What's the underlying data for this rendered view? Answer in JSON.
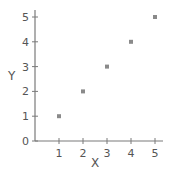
{
  "chart_data": {
    "type": "scatter",
    "title": "",
    "xlabel": "X",
    "ylabel": "Y",
    "x": [
      1,
      2,
      3,
      4,
      5
    ],
    "y": [
      1,
      2,
      3,
      4,
      5
    ],
    "series": [
      {
        "name": "",
        "x": [
          1,
          2,
          3,
          4,
          5
        ],
        "y": [
          1,
          2,
          3,
          4,
          5
        ],
        "color": "#8a8a8a",
        "marker": "square"
      }
    ],
    "xlim": [
      0,
      5.3
    ],
    "ylim": [
      0,
      5.2
    ],
    "xticks": [
      1,
      2,
      3,
      4,
      5
    ],
    "yticks": [
      0,
      1,
      2,
      3,
      4,
      5
    ],
    "xtick_labels": [
      "1",
      "2",
      "3",
      "4",
      "5"
    ],
    "ytick_labels": [
      "0",
      "1",
      "2",
      "3",
      "4",
      "5"
    ],
    "grid": false,
    "legend": null
  },
  "colors": {
    "axis": "#7a7a7a",
    "text": "#555555",
    "point": "#8a8a8a",
    "background": "#ffffff"
  }
}
